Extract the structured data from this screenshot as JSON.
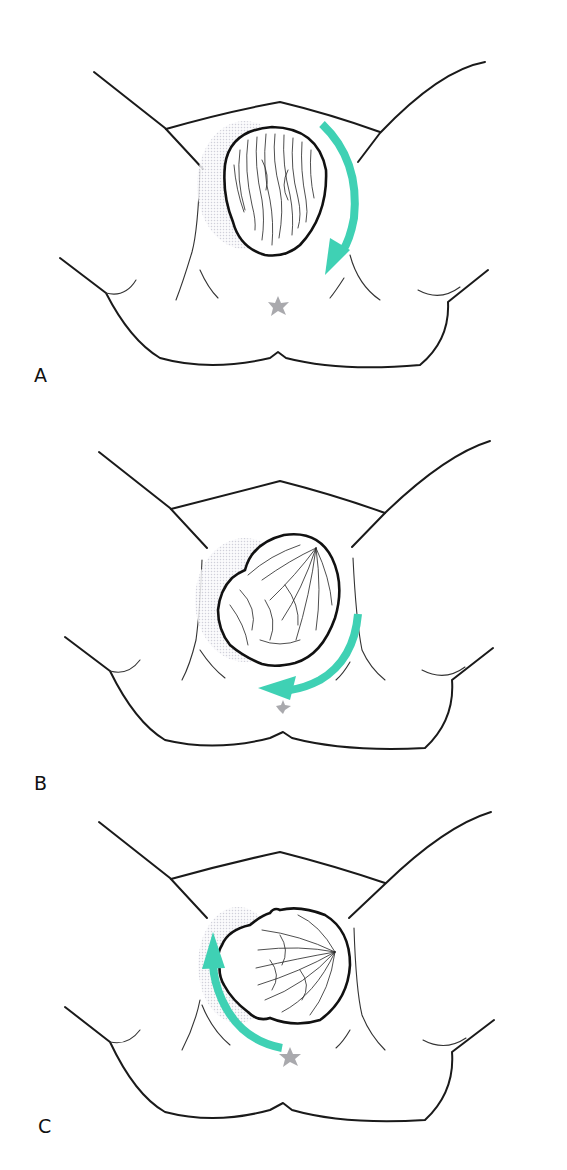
{
  "figure": {
    "accent_color": "#3fd1b4",
    "landmark_color": "#a9a9ad",
    "panels": [
      {
        "label": "A",
        "rotation_direction": "clockwise",
        "head_shape": "round-occiput-view",
        "icons": [
          "rotation-arrow-icon",
          "landmark-star-icon"
        ]
      },
      {
        "label": "B",
        "rotation_direction": "clockwise",
        "head_shape": "rotating-oblique",
        "icons": [
          "rotation-arrow-icon",
          "landmark-star-icon"
        ]
      },
      {
        "label": "C",
        "rotation_direction": "counterclockwise",
        "head_shape": "lateral-transverse",
        "icons": [
          "rotation-arrow-icon",
          "landmark-star-icon"
        ]
      }
    ]
  }
}
